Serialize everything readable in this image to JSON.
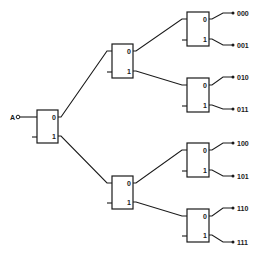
{
  "diagram": {
    "type": "demultiplexer-tree",
    "input": {
      "label": "A",
      "x": 13,
      "y": 117
    },
    "port_labels": {
      "zero": "0",
      "one": "1"
    },
    "blocks": [
      {
        "id": "root",
        "x": 37,
        "y": 110,
        "w": 21,
        "h": 33,
        "level": 1
      },
      {
        "id": "l2-top",
        "x": 112,
        "y": 44,
        "w": 21,
        "h": 34,
        "level": 2
      },
      {
        "id": "l2-bottom",
        "x": 112,
        "y": 176,
        "w": 21,
        "h": 33,
        "level": 2
      },
      {
        "id": "l3-0",
        "x": 187,
        "y": 12,
        "w": 22,
        "h": 34,
        "level": 3
      },
      {
        "id": "l3-1",
        "x": 187,
        "y": 78,
        "w": 22,
        "h": 34,
        "level": 3
      },
      {
        "id": "l3-2",
        "x": 187,
        "y": 143,
        "w": 22,
        "h": 34,
        "level": 3
      },
      {
        "id": "l3-3",
        "x": 187,
        "y": 209,
        "w": 22,
        "h": 33,
        "level": 3
      }
    ],
    "connections": [
      {
        "from": "root",
        "port": "0",
        "to": "l2-top"
      },
      {
        "from": "root",
        "port": "1",
        "to": "l2-bottom"
      },
      {
        "from": "l2-top",
        "port": "0",
        "to": "l3-0"
      },
      {
        "from": "l2-top",
        "port": "1",
        "to": "l3-1"
      },
      {
        "from": "l2-bottom",
        "port": "0",
        "to": "l3-2"
      },
      {
        "from": "l2-bottom",
        "port": "1",
        "to": "l3-3"
      }
    ],
    "outputs": [
      {
        "label": "000",
        "from": "l3-0",
        "port": "0",
        "y": 13
      },
      {
        "label": "001",
        "from": "l3-0",
        "port": "1",
        "y": 45
      },
      {
        "label": "010",
        "from": "l3-1",
        "port": "0",
        "y": 77
      },
      {
        "label": "011",
        "from": "l3-1",
        "port": "1",
        "y": 109
      },
      {
        "label": "100",
        "from": "l3-2",
        "port": "0",
        "y": 143
      },
      {
        "label": "101",
        "from": "l3-2",
        "port": "1",
        "y": 176
      },
      {
        "label": "110",
        "from": "l3-3",
        "port": "0",
        "y": 208
      },
      {
        "label": "111",
        "from": "l3-3",
        "port": "1",
        "y": 242
      }
    ],
    "colors": {
      "line": "#1a1a1a",
      "background": "#ffffff"
    }
  }
}
